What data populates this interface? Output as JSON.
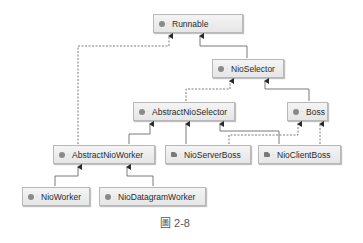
{
  "diagram": {
    "type": "class-hierarchy",
    "nodes": {
      "runnable": {
        "label": "Runnable",
        "kind": "interface"
      },
      "nio_selector": {
        "label": "NioSelector",
        "kind": "interface"
      },
      "abstract_nio_selector": {
        "label": "AbstractNioSelector",
        "kind": "abstract-class"
      },
      "boss": {
        "label": "Boss",
        "kind": "interface"
      },
      "abstract_nio_worker": {
        "label": "AbstractNioWorker",
        "kind": "abstract-class"
      },
      "nio_server_boss": {
        "label": "NioServerBoss",
        "kind": "class"
      },
      "nio_client_boss": {
        "label": "NioClientBoss",
        "kind": "class"
      },
      "nio_worker": {
        "label": "NioWorker",
        "kind": "class"
      },
      "nio_datagram_worker": {
        "label": "NioDatagramWorker",
        "kind": "class"
      }
    },
    "edges": [
      {
        "from": "AbstractNioWorker",
        "to": "Runnable",
        "style": "dashed",
        "relation": "implements"
      },
      {
        "from": "NioSelector",
        "to": "Runnable",
        "style": "solid",
        "relation": "extends"
      },
      {
        "from": "AbstractNioSelector",
        "to": "NioSelector",
        "style": "dashed",
        "relation": "implements"
      },
      {
        "from": "Boss",
        "to": "NioSelector",
        "style": "solid",
        "relation": "extends"
      },
      {
        "from": "AbstractNioWorker",
        "to": "AbstractNioSelector",
        "style": "solid",
        "relation": "extends"
      },
      {
        "from": "NioServerBoss",
        "to": "AbstractNioSelector",
        "style": "solid",
        "relation": "extends"
      },
      {
        "from": "NioClientBoss",
        "to": "AbstractNioSelector",
        "style": "solid",
        "relation": "extends"
      },
      {
        "from": "NioServerBoss",
        "to": "Boss",
        "style": "dashed",
        "relation": "implements"
      },
      {
        "from": "NioClientBoss",
        "to": "Boss",
        "style": "dashed",
        "relation": "implements"
      },
      {
        "from": "NioWorker",
        "to": "AbstractNioWorker",
        "style": "solid",
        "relation": "extends"
      },
      {
        "from": "NioDatagramWorker",
        "to": "AbstractNioWorker",
        "style": "solid",
        "relation": "extends"
      }
    ],
    "icons": {
      "interface": "interface-icon",
      "abstract-class": "abstract-class-icon",
      "class": "class-icon",
      "visibility": "public-visibility-icon"
    },
    "colors": {
      "line": "#6b6b6b",
      "node_border": "#b8b8b8",
      "node_fill_top": "#f4f4f4",
      "node_fill_bottom": "#e6e6e6",
      "text": "#2a2a2a"
    }
  },
  "caption": {
    "label": "圖 2-8"
  }
}
